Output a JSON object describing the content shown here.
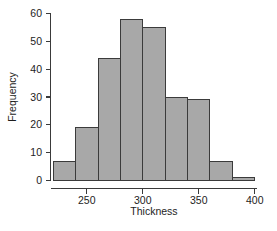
{
  "chart_data": {
    "type": "bar",
    "title": "",
    "subtitle": "",
    "xlabel": "Thickness",
    "ylabel": "Frequency",
    "xlim": [
      218,
      402
    ],
    "ylim": [
      0,
      60
    ],
    "grid": false,
    "legend": null,
    "bin_width": 20,
    "bin_edges": [
      220,
      240,
      260,
      280,
      300,
      320,
      340,
      360,
      380,
      400
    ],
    "categories": [
      "220-240",
      "240-260",
      "260-280",
      "280-300",
      "300-320",
      "320-340",
      "340-360",
      "360-380",
      "380-400"
    ],
    "values": [
      7,
      19,
      44,
      58,
      55,
      30,
      29,
      7,
      1
    ],
    "x_ticks": [
      250,
      300,
      350,
      400
    ],
    "x_tick_labels": [
      "250",
      "300",
      "350",
      "400"
    ],
    "y_ticks": [
      0,
      10,
      20,
      30,
      40,
      50,
      60
    ],
    "y_tick_labels": [
      "0",
      "10",
      "20",
      "30",
      "40",
      "50",
      "60"
    ],
    "bar_fill_color": "#a8a8a8",
    "bar_edge_color": "#3b3b3b",
    "axis_color": "#3a3a3a",
    "text_color": "#1d1d1d",
    "background_color": "#ffffff"
  }
}
